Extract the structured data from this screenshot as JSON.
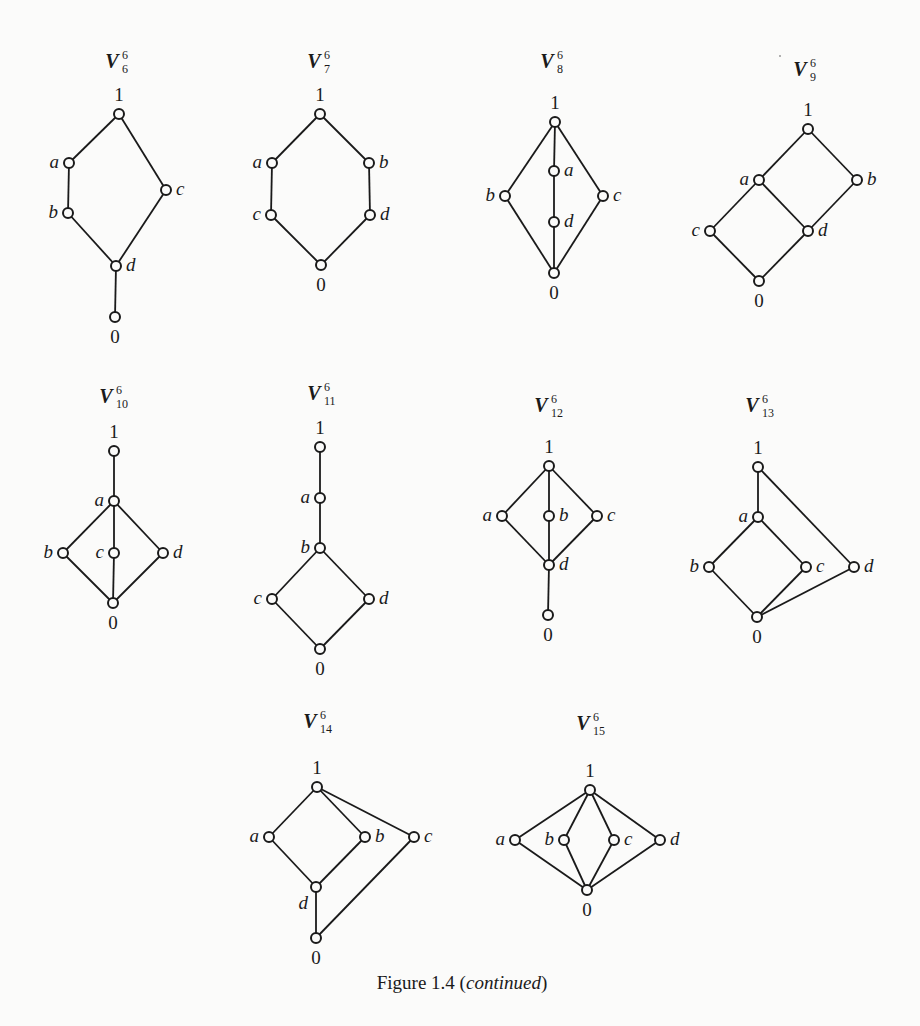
{
  "caption": {
    "prefix": "Figure 1.4 (",
    "italic": "continued",
    "suffix": ")",
    "x": 462,
    "y": 989
  },
  "colors": {
    "ink": "#1a1a1a",
    "paper": "#fbfbfa"
  },
  "lattices": [
    {
      "name": "V",
      "sup": "6",
      "sub": "6",
      "title_xy": [
        120,
        68
      ],
      "nodes": {
        "1": {
          "xy": [
            119,
            114
          ],
          "label": "1",
          "pos": "top"
        },
        "a": {
          "xy": [
            69,
            163
          ],
          "label": "a",
          "pos": "left"
        },
        "b": {
          "xy": [
            68,
            213
          ],
          "label": "b",
          "pos": "left"
        },
        "c": {
          "xy": [
            166,
            190
          ],
          "label": "c",
          "pos": "right"
        },
        "d": {
          "xy": [
            116,
            266
          ],
          "label": "d",
          "pos": "right"
        },
        "0": {
          "xy": [
            115,
            317
          ],
          "label": "0",
          "pos": "bottom"
        }
      },
      "edges": [
        [
          "1",
          "a"
        ],
        [
          "a",
          "b"
        ],
        [
          "b",
          "d"
        ],
        [
          "1",
          "c"
        ],
        [
          "c",
          "d"
        ],
        [
          "d",
          "0"
        ]
      ]
    },
    {
      "name": "V",
      "sup": "6",
      "sub": "7",
      "title_xy": [
        322,
        68
      ],
      "nodes": {
        "1": {
          "xy": [
            320,
            114
          ],
          "label": "1",
          "pos": "top"
        },
        "a": {
          "xy": [
            272,
            163
          ],
          "label": "a",
          "pos": "left"
        },
        "b": {
          "xy": [
            369,
            163
          ],
          "label": "b",
          "pos": "right"
        },
        "c": {
          "xy": [
            271,
            215
          ],
          "label": "c",
          "pos": "left"
        },
        "d": {
          "xy": [
            370,
            215
          ],
          "label": "d",
          "pos": "right"
        },
        "0": {
          "xy": [
            321,
            265
          ],
          "label": "0",
          "pos": "bottom"
        }
      },
      "edges": [
        [
          "1",
          "a"
        ],
        [
          "a",
          "c"
        ],
        [
          "c",
          "0"
        ],
        [
          "1",
          "b"
        ],
        [
          "b",
          "d"
        ],
        [
          "d",
          "0"
        ]
      ]
    },
    {
      "name": "V",
      "sup": "6",
      "sub": "8",
      "title_xy": [
        555,
        68
      ],
      "nodes": {
        "1": {
          "xy": [
            555,
            122
          ],
          "label": "1",
          "pos": "top"
        },
        "a": {
          "xy": [
            554,
            171
          ],
          "label": "a",
          "pos": "right"
        },
        "d": {
          "xy": [
            554,
            222
          ],
          "label": "d",
          "pos": "right"
        },
        "b": {
          "xy": [
            505,
            196
          ],
          "label": "b",
          "pos": "left"
        },
        "c": {
          "xy": [
            603,
            196
          ],
          "label": "c",
          "pos": "right"
        },
        "0": {
          "xy": [
            554,
            273
          ],
          "label": "0",
          "pos": "bottom"
        }
      },
      "edges": [
        [
          "1",
          "a"
        ],
        [
          "a",
          "d"
        ],
        [
          "d",
          "0"
        ],
        [
          "1",
          "b"
        ],
        [
          "b",
          "0"
        ],
        [
          "1",
          "c"
        ],
        [
          "c",
          "0"
        ]
      ]
    },
    {
      "name": "V",
      "sup": "6",
      "sub": "9",
      "title_xy": [
        808,
        76
      ],
      "nodes": {
        "1": {
          "xy": [
            808,
            129
          ],
          "label": "1",
          "pos": "top"
        },
        "a": {
          "xy": [
            759,
            180
          ],
          "label": "a",
          "pos": "left"
        },
        "b": {
          "xy": [
            857,
            180
          ],
          "label": "b",
          "pos": "right"
        },
        "c": {
          "xy": [
            710,
            231
          ],
          "label": "c",
          "pos": "left"
        },
        "d": {
          "xy": [
            808,
            231
          ],
          "label": "d",
          "pos": "right"
        },
        "0": {
          "xy": [
            759,
            281
          ],
          "label": "0",
          "pos": "bottom"
        }
      },
      "edges": [
        [
          "1",
          "a"
        ],
        [
          "1",
          "b"
        ],
        [
          "a",
          "c"
        ],
        [
          "a",
          "d"
        ],
        [
          "b",
          "d"
        ],
        [
          "c",
          "0"
        ],
        [
          "d",
          "0"
        ]
      ]
    },
    {
      "name": "V",
      "sup": "6",
      "sub": "10",
      "title_xy": [
        114,
        403
      ],
      "nodes": {
        "1": {
          "xy": [
            114,
            451
          ],
          "label": "1",
          "pos": "top"
        },
        "a": {
          "xy": [
            114,
            501
          ],
          "label": "a",
          "pos": "left"
        },
        "b": {
          "xy": [
            63,
            553
          ],
          "label": "b",
          "pos": "left"
        },
        "c": {
          "xy": [
            114,
            553
          ],
          "label": "c",
          "pos": "left"
        },
        "d": {
          "xy": [
            163,
            553
          ],
          "label": "d",
          "pos": "right"
        },
        "0": {
          "xy": [
            113,
            603
          ],
          "label": "0",
          "pos": "bottom"
        }
      },
      "edges": [
        [
          "1",
          "a"
        ],
        [
          "a",
          "b"
        ],
        [
          "a",
          "c"
        ],
        [
          "a",
          "d"
        ],
        [
          "b",
          "0"
        ],
        [
          "c",
          "0"
        ],
        [
          "d",
          "0"
        ]
      ]
    },
    {
      "name": "V",
      "sup": "6",
      "sub": "11",
      "title_xy": [
        322,
        400
      ],
      "nodes": {
        "1": {
          "xy": [
            320,
            447
          ],
          "label": "1",
          "pos": "top"
        },
        "a": {
          "xy": [
            320,
            498
          ],
          "label": "a",
          "pos": "left"
        },
        "b": {
          "xy": [
            320,
            548
          ],
          "label": "b",
          "pos": "left"
        },
        "c": {
          "xy": [
            272,
            599
          ],
          "label": "c",
          "pos": "left"
        },
        "d": {
          "xy": [
            369,
            599
          ],
          "label": "d",
          "pos": "right"
        },
        "0": {
          "xy": [
            320,
            649
          ],
          "label": "0",
          "pos": "bottom"
        }
      },
      "edges": [
        [
          "1",
          "a"
        ],
        [
          "a",
          "b"
        ],
        [
          "b",
          "c"
        ],
        [
          "b",
          "d"
        ],
        [
          "c",
          "0"
        ],
        [
          "d",
          "0"
        ]
      ]
    },
    {
      "name": "V",
      "sup": "6",
      "sub": "12",
      "title_xy": [
        549,
        412
      ],
      "nodes": {
        "1": {
          "xy": [
            549,
            466
          ],
          "label": "1",
          "pos": "top"
        },
        "a": {
          "xy": [
            502,
            516
          ],
          "label": "a",
          "pos": "left"
        },
        "b": {
          "xy": [
            549,
            516
          ],
          "label": "b",
          "pos": "right"
        },
        "c": {
          "xy": [
            597,
            516
          ],
          "label": "c",
          "pos": "right"
        },
        "d": {
          "xy": [
            549,
            565
          ],
          "label": "d",
          "pos": "right"
        },
        "0": {
          "xy": [
            548,
            615
          ],
          "label": "0",
          "pos": "bottom"
        }
      },
      "edges": [
        [
          "1",
          "a"
        ],
        [
          "1",
          "b"
        ],
        [
          "1",
          "c"
        ],
        [
          "a",
          "d"
        ],
        [
          "b",
          "d"
        ],
        [
          "c",
          "d"
        ],
        [
          "d",
          "0"
        ]
      ]
    },
    {
      "name": "V",
      "sup": "6",
      "sub": "13",
      "title_xy": [
        760,
        412
      ],
      "nodes": {
        "1": {
          "xy": [
            758,
            467
          ],
          "label": "1",
          "pos": "top"
        },
        "a": {
          "xy": [
            758,
            517
          ],
          "label": "a",
          "pos": "left"
        },
        "b": {
          "xy": [
            709,
            567
          ],
          "label": "b",
          "pos": "left"
        },
        "c": {
          "xy": [
            806,
            567
          ],
          "label": "c",
          "pos": "right"
        },
        "d": {
          "xy": [
            854,
            567
          ],
          "label": "d",
          "pos": "right"
        },
        "0": {
          "xy": [
            757,
            617
          ],
          "label": "0",
          "pos": "bottom"
        }
      },
      "edges": [
        [
          "1",
          "a"
        ],
        [
          "1",
          "d"
        ],
        [
          "a",
          "b"
        ],
        [
          "a",
          "c"
        ],
        [
          "b",
          "0"
        ],
        [
          "c",
          "0"
        ],
        [
          "d",
          "0"
        ]
      ]
    },
    {
      "name": "V",
      "sup": "6",
      "sub": "14",
      "title_xy": [
        318,
        728
      ],
      "nodes": {
        "1": {
          "xy": [
            317,
            787
          ],
          "label": "1",
          "pos": "top"
        },
        "a": {
          "xy": [
            269,
            837
          ],
          "label": "a",
          "pos": "left"
        },
        "b": {
          "xy": [
            365,
            837
          ],
          "label": "b",
          "pos": "right"
        },
        "c": {
          "xy": [
            414,
            837
          ],
          "label": "c",
          "pos": "right"
        },
        "d": {
          "xy": [
            316,
            887
          ],
          "label": "d",
          "pos": "left-below"
        },
        "0": {
          "xy": [
            316,
            938
          ],
          "label": "0",
          "pos": "bottom"
        }
      },
      "edges": [
        [
          "1",
          "a"
        ],
        [
          "1",
          "b"
        ],
        [
          "1",
          "c"
        ],
        [
          "a",
          "d"
        ],
        [
          "b",
          "d"
        ],
        [
          "d",
          "0"
        ],
        [
          "c",
          "0"
        ]
      ]
    },
    {
      "name": "V",
      "sup": "6",
      "sub": "15",
      "title_xy": [
        591,
        730
      ],
      "nodes": {
        "1": {
          "xy": [
            590,
            790
          ],
          "label": "1",
          "pos": "top"
        },
        "a": {
          "xy": [
            515,
            840
          ],
          "label": "a",
          "pos": "left"
        },
        "b": {
          "xy": [
            564,
            840
          ],
          "label": "b",
          "pos": "left"
        },
        "c": {
          "xy": [
            614,
            840
          ],
          "label": "c",
          "pos": "right"
        },
        "d": {
          "xy": [
            660,
            840
          ],
          "label": "d",
          "pos": "right"
        },
        "0": {
          "xy": [
            587,
            890
          ],
          "label": "0",
          "pos": "bottom"
        }
      },
      "edges": [
        [
          "1",
          "a"
        ],
        [
          "1",
          "b"
        ],
        [
          "1",
          "c"
        ],
        [
          "1",
          "d"
        ],
        [
          "a",
          "0"
        ],
        [
          "b",
          "0"
        ],
        [
          "c",
          "0"
        ],
        [
          "d",
          "0"
        ]
      ]
    }
  ]
}
